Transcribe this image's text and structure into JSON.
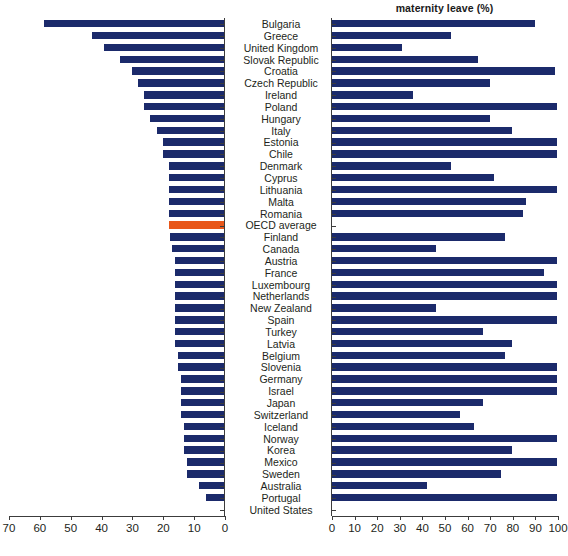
{
  "chart_data": {
    "type": "bar",
    "title": "maternity leave (%)",
    "orientation": "horizontal",
    "layout": "back-to-back paired panels sharing centered category labels",
    "grid": false,
    "legend": null,
    "highlight_color": "#e8571b",
    "bar_color": "#1b2a6b",
    "panels": [
      {
        "id": "left",
        "title": "",
        "xlabel": "",
        "xlim": [
          70,
          0
        ],
        "direction": "right-to-left",
        "ticks": [
          70,
          60,
          50,
          40,
          30,
          20,
          10,
          0
        ]
      },
      {
        "id": "right",
        "title": "maternity leave (%)",
        "xlabel": "",
        "xlim": [
          0,
          100
        ],
        "direction": "left-to-right",
        "ticks": [
          0,
          10,
          20,
          30,
          40,
          50,
          60,
          70,
          80,
          90,
          100
        ]
      }
    ],
    "categories": [
      "Bulgaria",
      "Greece",
      "United Kingdom",
      "Slovak Republic",
      "Croatia",
      "Czech Republic",
      "Ireland",
      "Poland",
      "Hungary",
      "Italy",
      "Estonia",
      "Chile",
      "Denmark",
      "Cyprus",
      "Lithuania",
      "Malta",
      "Romania",
      "OECD average",
      "Finland",
      "Canada",
      "Austria",
      "France",
      "Luxembourg",
      "Netherlands",
      "New Zealand",
      "Spain",
      "Turkey",
      "Latvia",
      "Belgium",
      "Slovenia",
      "Germany",
      "Israel",
      "Japan",
      "Switzerland",
      "Iceland",
      "Norway",
      "Korea",
      "Mexico",
      "Sweden",
      "Australia",
      "Portugal",
      "United States"
    ],
    "series": [
      {
        "name": "length of maternity leave (weeks)",
        "panel": "left",
        "values": [
          58.6,
          43.0,
          39.0,
          34.0,
          30.0,
          28.0,
          26.0,
          26.0,
          24.0,
          21.7,
          20.0,
          20.0,
          18.0,
          18.0,
          18.0,
          18.0,
          18.0,
          18.0,
          17.5,
          17.0,
          16.0,
          16.0,
          16.0,
          16.0,
          16.0,
          16.0,
          16.0,
          16.0,
          15.0,
          15.0,
          14.0,
          14.0,
          14.0,
          14.0,
          13.0,
          13.0,
          12.9,
          12.0,
          12.0,
          8.0,
          6.0,
          0.0
        ]
      },
      {
        "name": "maternity leave payment rate (%)",
        "panel": "right",
        "values": [
          90.0,
          53.0,
          31.0,
          65.0,
          99.0,
          70.0,
          36.0,
          100.0,
          70.0,
          80.0,
          100.0,
          100.0,
          53.0,
          72.0,
          100.0,
          86.0,
          85.0,
          null,
          77.0,
          46.0,
          100.0,
          94.0,
          100.0,
          100.0,
          46.0,
          100.0,
          67.0,
          80.0,
          77.0,
          100.0,
          100.0,
          100.0,
          67.0,
          57.0,
          63.0,
          100.0,
          80.0,
          100.0,
          75.0,
          42.0,
          100.0,
          null
        ]
      }
    ]
  }
}
